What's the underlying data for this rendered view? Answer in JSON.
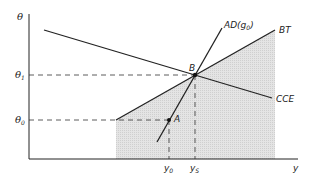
{
  "diagram": {
    "axes": {
      "y_label": "θ",
      "x_label": "y"
    },
    "y_ticks": [
      {
        "label": "θ",
        "sub": "1",
        "name": "theta-1"
      },
      {
        "label": "θ",
        "sub": "0",
        "name": "theta-0"
      }
    ],
    "x_ticks": [
      {
        "label": "y",
        "sub": "0",
        "name": "y-0"
      },
      {
        "label": "y",
        "sub": "S",
        "name": "y-s"
      }
    ],
    "curves": {
      "ad": {
        "label": "AD(g",
        "sub": "0",
        "close": ")"
      },
      "bt": {
        "label": "BT"
      },
      "cce": {
        "label": "CCE"
      }
    },
    "points": {
      "a": {
        "label": "A"
      },
      "b": {
        "label": "B"
      }
    },
    "colors": {
      "line": "#222222",
      "shade": "#dcdcdc"
    }
  }
}
